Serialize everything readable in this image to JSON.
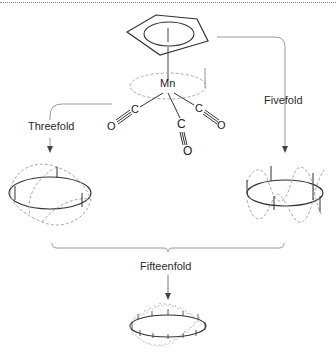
{
  "diagram": {
    "molecule": {
      "metal": "Mn",
      "ring": "cyclopentadienyl",
      "ligands": [
        {
          "c": "C",
          "o": "O",
          "position": "left"
        },
        {
          "c": "C",
          "o": "O",
          "position": "center"
        },
        {
          "c": "C",
          "o": "O",
          "position": "right"
        }
      ]
    },
    "labels": {
      "threefold": "Threefold",
      "fivefold": "Fivefold",
      "fifteenfold": "Fifteenfold"
    },
    "waves": [
      {
        "name": "threefold-wave",
        "periods": 3
      },
      {
        "name": "fivefold-wave",
        "periods": 5
      },
      {
        "name": "fifteenfold-wave",
        "periods": 15
      }
    ],
    "colors": {
      "line": "#333333",
      "dashed": "#a8a8a8",
      "arrow": "#8c8c8c"
    }
  }
}
